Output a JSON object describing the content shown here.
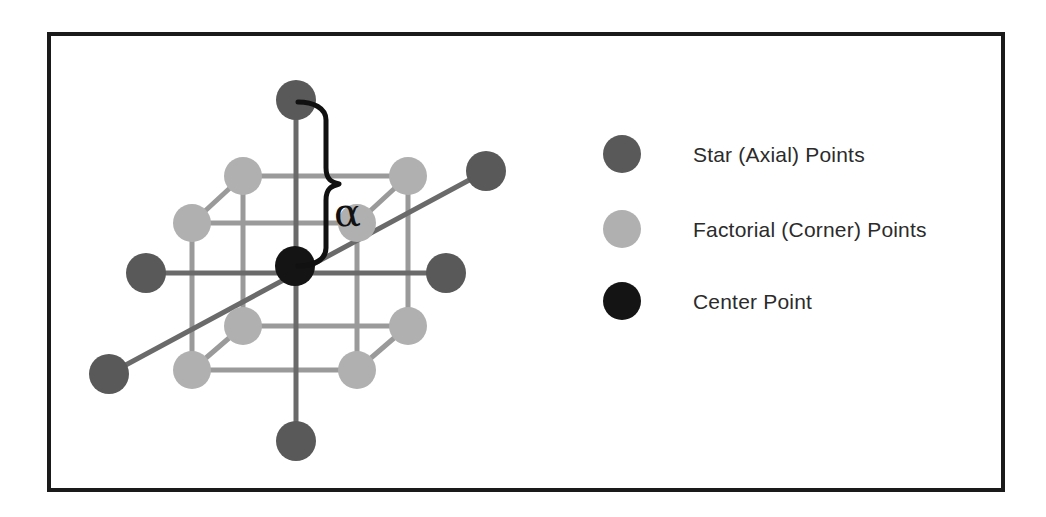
{
  "figure": {
    "frame_border_color": "#1a1a1a",
    "background": "#ffffff",
    "annotation_label": "α",
    "annotation_name": "alpha-distance-label"
  },
  "legend": {
    "items": [
      {
        "label": "Star (Axial) Points",
        "color": "#595959",
        "marker": "filled-circle-dark-gray"
      },
      {
        "label": "Factorial (Corner) Points",
        "color": "#b0b0b0",
        "marker": "filled-circle-light-gray"
      },
      {
        "label": "Center Point",
        "color": "#141414",
        "marker": "filled-circle-black"
      }
    ]
  },
  "chart_data": {
    "type": "scatter",
    "title": "",
    "subtitle": "",
    "xlabel": "",
    "ylabel": "",
    "grid": false,
    "legend_position": "right",
    "annotations": [
      {
        "text": "α",
        "role": "brace-distance-from-center-to-axial-point",
        "x": 330,
        "y": 185
      }
    ],
    "series": [
      {
        "name": "Factorial (Corner) Points",
        "color": "#b0b0b0",
        "count": 8,
        "radius": 19,
        "points": [
          {
            "id": "corner-top-back-left",
            "x": 239,
            "y": 172,
            "coded": [
              -1,
              1,
              1
            ]
          },
          {
            "id": "corner-top-back-right",
            "x": 404,
            "y": 172,
            "coded": [
              1,
              1,
              1
            ]
          },
          {
            "id": "corner-top-front-left",
            "x": 188,
            "y": 219,
            "coded": [
              -1,
              -1,
              1
            ]
          },
          {
            "id": "corner-top-front-right",
            "x": 353,
            "y": 219,
            "coded": [
              1,
              -1,
              1
            ]
          },
          {
            "id": "corner-bottom-back-left",
            "x": 239,
            "y": 322,
            "coded": [
              -1,
              1,
              -1
            ]
          },
          {
            "id": "corner-bottom-back-right",
            "x": 404,
            "y": 322,
            "coded": [
              1,
              1,
              -1
            ]
          },
          {
            "id": "corner-bottom-front-left",
            "x": 188,
            "y": 366,
            "coded": [
              -1,
              -1,
              -1
            ]
          },
          {
            "id": "corner-bottom-front-right",
            "x": 353,
            "y": 366,
            "coded": [
              1,
              -1,
              -1
            ]
          }
        ]
      },
      {
        "name": "Star (Axial) Points",
        "color": "#595959",
        "count": 6,
        "radius": 20,
        "points": [
          {
            "id": "axial-top",
            "x": 292,
            "y": 96,
            "coded": [
              0,
              0,
              1.682
            ]
          },
          {
            "id": "axial-bottom",
            "x": 292,
            "y": 437,
            "coded": [
              0,
              0,
              -1.682
            ]
          },
          {
            "id": "axial-left",
            "x": 142,
            "y": 269,
            "coded": [
              -1.682,
              0,
              0
            ]
          },
          {
            "id": "axial-right",
            "x": 442,
            "y": 269,
            "coded": [
              1.682,
              0,
              0
            ]
          },
          {
            "id": "axial-back-upper",
            "x": 482,
            "y": 167,
            "coded": [
              0,
              1.682,
              0
            ]
          },
          {
            "id": "axial-front-lower",
            "x": 105,
            "y": 370,
            "coded": [
              0,
              -1.682,
              0
            ]
          }
        ]
      },
      {
        "name": "Center Point",
        "color": "#141414",
        "count": 1,
        "radius": 20,
        "points": [
          {
            "id": "center",
            "x": 291,
            "y": 262,
            "coded": [
              0,
              0,
              0
            ]
          }
        ]
      }
    ],
    "edges": {
      "cube_edge_color": "#9a9a9a",
      "axis_line_color": "#6a6a6a"
    }
  }
}
